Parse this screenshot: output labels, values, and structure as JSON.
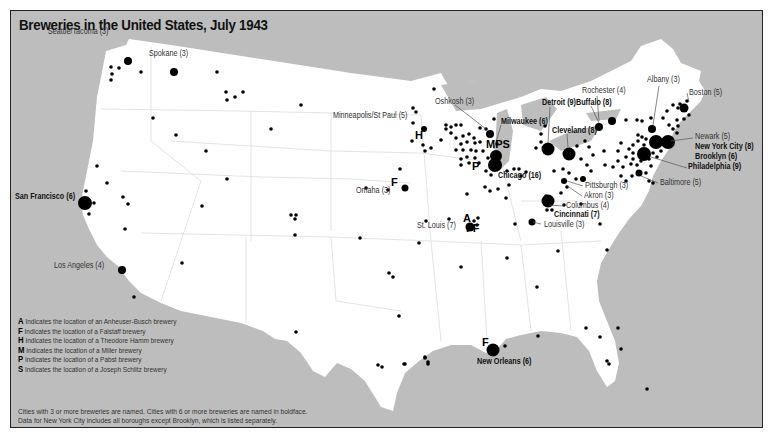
{
  "title": "Breweries in the United States, July 1943",
  "colors": {
    "water": "#bdbdbd",
    "land": "#ffffff",
    "dot": "#000000",
    "frame": "#222222"
  },
  "cities": [
    {
      "name": "Seattle/Tacoma (3)",
      "bold": false,
      "x": 47,
      "y": 27
    },
    {
      "name": "Spokane (3)",
      "bold": false,
      "x": 148,
      "y": 49
    },
    {
      "name": "San Francisco (6)",
      "bold": true,
      "x": 14,
      "y": 192
    },
    {
      "name": "Los Angeles (4)",
      "bold": false,
      "x": 53,
      "y": 261
    },
    {
      "name": "Omaha (3)",
      "bold": false,
      "x": 355,
      "y": 186
    },
    {
      "name": "Oshkosh (3)",
      "bold": false,
      "x": 434,
      "y": 97
    },
    {
      "name": "Minneapolis/St Paul (5)",
      "bold": false,
      "x": 332,
      "y": 111
    },
    {
      "name": "Milwaukee (6)",
      "bold": true,
      "x": 500,
      "y": 117
    },
    {
      "name": "Detroit (9)",
      "bold": true,
      "x": 541,
      "y": 98
    },
    {
      "name": "Cleveland (8)",
      "bold": true,
      "x": 551,
      "y": 126
    },
    {
      "name": "Rochester (4)",
      "bold": false,
      "x": 581,
      "y": 86
    },
    {
      "name": "Buffalo (8)",
      "bold": true,
      "x": 575,
      "y": 98
    },
    {
      "name": "Albany (3)",
      "bold": false,
      "x": 646,
      "y": 75
    },
    {
      "name": "Boston (5)",
      "bold": false,
      "x": 688,
      "y": 88
    },
    {
      "name": "Newark (5)",
      "bold": false,
      "x": 694,
      "y": 132
    },
    {
      "name": "New York City (8)",
      "bold": true,
      "x": 694,
      "y": 142
    },
    {
      "name": "Brooklyn (6)",
      "bold": true,
      "x": 694,
      "y": 152
    },
    {
      "name": "Philadelphia (9)",
      "bold": true,
      "x": 687,
      "y": 162
    },
    {
      "name": "Baltimore (5)",
      "bold": false,
      "x": 659,
      "y": 178
    },
    {
      "name": "Chicago (16)",
      "bold": true,
      "x": 497,
      "y": 171
    },
    {
      "name": "Pittsburgh (3)",
      "bold": false,
      "x": 584,
      "y": 181
    },
    {
      "name": "Akron (3)",
      "bold": false,
      "x": 583,
      "y": 191
    },
    {
      "name": "Columbus (4)",
      "bold": false,
      "x": 565,
      "y": 201
    },
    {
      "name": "Cincinnati (7)",
      "bold": true,
      "x": 553,
      "y": 210
    },
    {
      "name": "Louisville (3)",
      "bold": false,
      "x": 543,
      "y": 220
    },
    {
      "name": "St. Louis (7)",
      "bold": false,
      "x": 416,
      "y": 221
    },
    {
      "name": "New Orleans (6)",
      "bold": true,
      "x": 476,
      "y": 357
    }
  ],
  "company_markers": [
    {
      "letter": "H",
      "x": 414,
      "y": 129
    },
    {
      "letter": "MPS",
      "x": 485,
      "y": 138
    },
    {
      "letter": "P",
      "x": 471,
      "y": 160
    },
    {
      "letter": "F",
      "x": 390,
      "y": 176
    },
    {
      "letter": "A",
      "x": 462,
      "y": 212
    },
    {
      "letter": "FF",
      "x": 465,
      "y": 222
    },
    {
      "letter": "F",
      "x": 481,
      "y": 336
    }
  ],
  "legend": [
    {
      "key": "A",
      "text": "Indicates the location of an Anheuser-Busch brewery"
    },
    {
      "key": "F",
      "text": "Indicates the location of a Falstaff brewery"
    },
    {
      "key": "H",
      "text": "Indicates the location of a Theodore Hamm brewery"
    },
    {
      "key": "M",
      "text": "Indicates the location of a Miller brewery"
    },
    {
      "key": "P",
      "text": "Indicates the location of a Pabst brewery"
    },
    {
      "key": "S",
      "text": "Indicates the location of a Joseph Schlitz brewery"
    }
  ],
  "notes": [
    "Cities with 3 or more breweries are named. Cities with 6 or more breweries are named in boldface.",
    "Data for New York City includes all boroughs except Brooklyn, which is listed separately."
  ]
}
